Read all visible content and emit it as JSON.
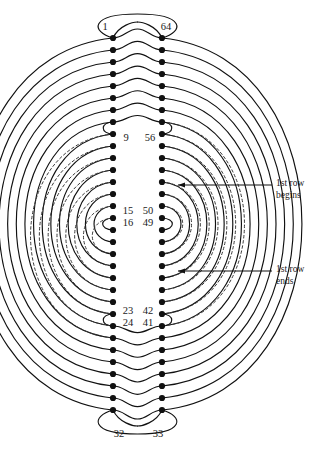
{
  "figure": {
    "type": "diagram",
    "background": "#ffffff",
    "stroke_color": "#111111",
    "dot_color": "#111111",
    "dashed_color": "#444444",
    "width": 330,
    "height": 458
  },
  "columns": {
    "left_x": 113,
    "right_x": 162,
    "top_y": 38,
    "dot_spacing": 12.0,
    "dots_per_column": 32
  },
  "labels": {
    "top_left": "1",
    "top_right": "64",
    "mid_upper_left": "9",
    "mid_upper_right": "56",
    "upper_end_left": "15",
    "upper_end_right": "50",
    "lower_start_left": "16",
    "lower_start_right": "49",
    "mid_lower_left": "23",
    "mid_lower_right": "42",
    "inner_lower_left": "24",
    "inner_lower_right": "41",
    "bottom_left": "32",
    "bottom_right": "33"
  },
  "label_positions": [
    {
      "key": "top_left",
      "text": "1",
      "x": 105,
      "y": 30,
      "anchor": "middle"
    },
    {
      "key": "top_right",
      "text": "64",
      "x": 166,
      "y": 30,
      "anchor": "middle"
    },
    {
      "key": "mid_upper_left",
      "text": "9",
      "x": 126,
      "y": 141,
      "anchor": "middle"
    },
    {
      "key": "mid_upper_right",
      "text": "56",
      "x": 150,
      "y": 141,
      "anchor": "middle"
    },
    {
      "key": "upper_end_left",
      "text": "15",
      "x": 128,
      "y": 214,
      "anchor": "middle"
    },
    {
      "key": "upper_end_right",
      "text": "50",
      "x": 148,
      "y": 214,
      "anchor": "middle"
    },
    {
      "key": "lower_start_left",
      "text": "16",
      "x": 128,
      "y": 226,
      "anchor": "middle"
    },
    {
      "key": "lower_start_right",
      "text": "49",
      "x": 148,
      "y": 226,
      "anchor": "middle"
    },
    {
      "key": "mid_lower_left",
      "text": "23",
      "x": 128,
      "y": 314,
      "anchor": "middle"
    },
    {
      "key": "mid_lower_right",
      "text": "42",
      "x": 148,
      "y": 314,
      "anchor": "middle"
    },
    {
      "key": "inner_lower_left",
      "text": "24",
      "x": 128,
      "y": 326,
      "anchor": "middle"
    },
    {
      "key": "inner_lower_right",
      "text": "41",
      "x": 148,
      "y": 326,
      "anchor": "middle"
    },
    {
      "key": "bottom_left",
      "text": "32",
      "x": 119,
      "y": 437,
      "anchor": "middle"
    },
    {
      "key": "bottom_right",
      "text": "33",
      "x": 158,
      "y": 437,
      "anchor": "middle"
    }
  ],
  "annotations": [
    {
      "name": "first-row-begins",
      "line1": "1st row",
      "line2": "begins",
      "text_x": 276,
      "text_y": 186,
      "arrow_from_x": 272,
      "arrow_from_y": 185,
      "arrow_to_x": 178,
      "arrow_to_y": 185
    },
    {
      "name": "first-row-ends",
      "line1": "1st row",
      "line2": "ends",
      "text_x": 276,
      "text_y": 272,
      "arrow_from_x": 272,
      "arrow_from_y": 271,
      "arrow_to_x": 178,
      "arrow_to_y": 271
    }
  ],
  "caption_fragment": "Figure 1.1"
}
